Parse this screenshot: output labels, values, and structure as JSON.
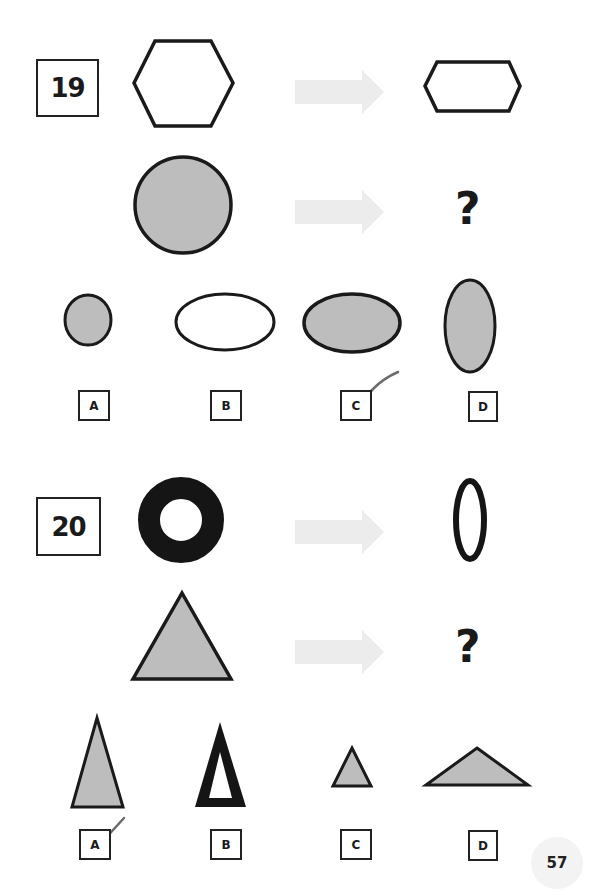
{
  "page": {
    "page_number": "57"
  },
  "questions": [
    {
      "number": "19",
      "example": {
        "from_shape": "regular hexagon (outline)",
        "to_shape": "flattened hexagon (outline)"
      },
      "problem": {
        "from_shape": "gray-filled circle",
        "to_shape": "?"
      },
      "options": [
        {
          "label": "A",
          "shape": "small gray-filled circle"
        },
        {
          "label": "B",
          "shape": "white horizontal ellipse"
        },
        {
          "label": "C",
          "shape": "gray-filled horizontal ellipse",
          "checked": true
        },
        {
          "label": "D",
          "shape": "gray-filled vertical ellipse"
        }
      ]
    },
    {
      "number": "20",
      "example": {
        "from_shape": "black ring (donut)",
        "to_shape": "narrow black vertical oval ring"
      },
      "problem": {
        "from_shape": "gray-filled equilateral triangle",
        "to_shape": "?"
      },
      "options": [
        {
          "label": "A",
          "shape": "tall narrow gray-filled triangle",
          "checked": true
        },
        {
          "label": "B",
          "shape": "tall narrow thick black outline triangle"
        },
        {
          "label": "C",
          "shape": "small gray-filled triangle"
        },
        {
          "label": "D",
          "shape": "wide flat gray-filled triangle"
        }
      ]
    }
  ],
  "colors": {
    "stroke": "#1a1a1a",
    "fill_gray": "#bdbdbd",
    "arrow": "#ececec",
    "check": "#6b6b6b"
  }
}
